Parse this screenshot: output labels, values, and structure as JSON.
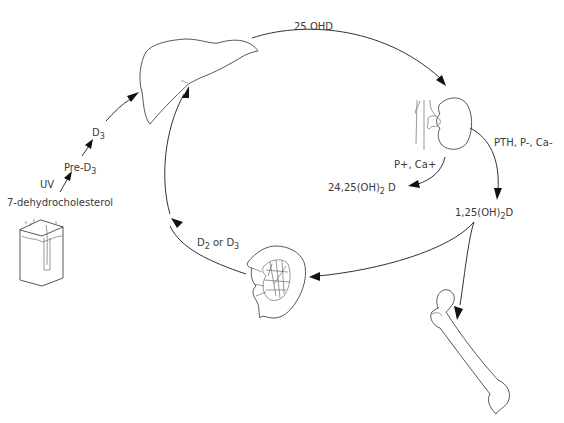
{
  "diagram": {
    "organs": [
      {
        "id": "skin",
        "name": "Skin"
      },
      {
        "id": "liver",
        "name": "Liver"
      },
      {
        "id": "kidney",
        "name": "Kidney"
      },
      {
        "id": "intestine",
        "name": "Intestine"
      },
      {
        "id": "bone",
        "name": "Bone"
      }
    ],
    "labels": {
      "precursor": "7-dehydrocholesterol",
      "uv": "UV",
      "pre_d3": {
        "base": "Pre-D",
        "sub": "3"
      },
      "d3": {
        "base": "D",
        "sub": "3"
      },
      "hydroxy": "25 OHD",
      "kidney_regulators_up": "PTH, P-, Ca-",
      "kidney_regulators_down": "P+,  Ca+",
      "inactive_metabolite": {
        "pre": "24,25(OH)",
        "sub": "2",
        "post": " D"
      },
      "active_metabolite": {
        "pre": "1,25(OH)",
        "sub": "2",
        "post": "D"
      },
      "dietary": {
        "a": "D",
        "a_sub": "2",
        "mid": " or ",
        "b": "D",
        "b_sub": "3"
      }
    },
    "edges": [
      {
        "from": "7-dehydrocholesterol",
        "to": "Pre-D3",
        "label": "UV"
      },
      {
        "from": "Pre-D3",
        "to": "D3"
      },
      {
        "from": "D3",
        "to": "liver"
      },
      {
        "from": "liver",
        "to": "kidney",
        "label": "25 OHD"
      },
      {
        "from": "kidney",
        "to": "1,25(OH)2D",
        "label": "PTH, P-, Ca-"
      },
      {
        "from": "kidney",
        "to": "24,25(OH)2 D",
        "label": "P+, Ca+"
      },
      {
        "from": "1,25(OH)2D",
        "to": "intestine"
      },
      {
        "from": "1,25(OH)2D",
        "to": "bone"
      },
      {
        "from": "intestine",
        "to": "liver",
        "label": "D2 or D3"
      }
    ]
  }
}
